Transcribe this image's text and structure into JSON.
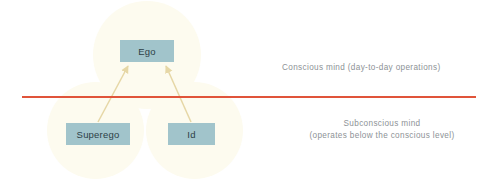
{
  "diagram": {
    "nodes": [
      {
        "id": "ego",
        "label": "Ego"
      },
      {
        "id": "superego",
        "label": "Superego"
      },
      {
        "id": "id",
        "label": "Id"
      }
    ],
    "annotations": {
      "conscious": "Conscious mind (day-to-day operations)",
      "subconscious_line1": "Subconscious mind",
      "subconscious_line2": "(operates below the conscious level)"
    },
    "colors": {
      "node_fill": "#a1c4cb",
      "node_text": "#2d3f46",
      "circle_fill": "#fdfbef",
      "divider": "#e0543a",
      "arrow": "#e6d7a6",
      "annotation_text": "#8d9296",
      "background": "#ffffff"
    },
    "edges": [
      {
        "from": "superego",
        "to": "ego"
      },
      {
        "from": "id",
        "to": "ego"
      }
    ]
  }
}
